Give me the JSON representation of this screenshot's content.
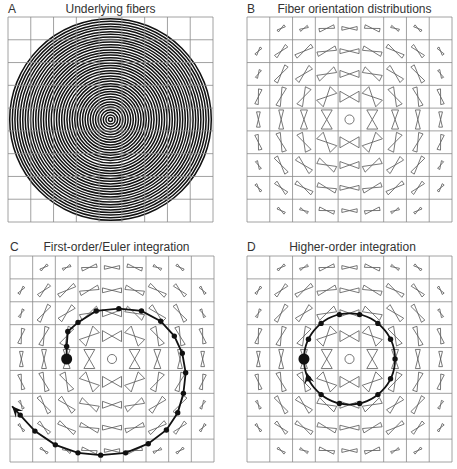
{
  "panels": [
    {
      "id": "A",
      "letter": "A",
      "title": "Underlying fibers",
      "kind": "fibers"
    },
    {
      "id": "B",
      "letter": "B",
      "title": "Fiber orientation distributions",
      "kind": "fod"
    },
    {
      "id": "C",
      "letter": "C",
      "title": "First-order/Euler integration",
      "kind": "fod",
      "trajectory": "euler"
    },
    {
      "id": "D",
      "letter": "D",
      "title": "Higher-order integration",
      "kind": "fod",
      "trajectory": "higher-order"
    }
  ],
  "grid": {
    "rows": 9,
    "cols": 9,
    "empty_cells": [
      [
        0,
        0
      ],
      [
        0,
        8
      ],
      [
        8,
        0
      ],
      [
        8,
        8
      ]
    ]
  },
  "colors": {
    "grid_line": "#8a8a8a",
    "fiber": "#111111",
    "glyph_stroke": "#555555",
    "trajectory": "#111111"
  },
  "trajectories": {
    "euler": {
      "description": "Spiral outward from seed at cell (4,2)",
      "points_in_cells": [
        [
          2.5,
          4.5
        ],
        [
          2.5,
          3.95
        ],
        [
          2.55,
          3.3
        ],
        [
          3.0,
          2.9
        ],
        [
          3.8,
          2.4
        ],
        [
          4.8,
          2.3
        ],
        [
          5.8,
          2.4
        ],
        [
          6.65,
          2.85
        ],
        [
          7.25,
          3.5
        ],
        [
          7.6,
          4.25
        ],
        [
          7.75,
          5.1
        ],
        [
          7.65,
          6.0
        ],
        [
          7.4,
          6.85
        ],
        [
          6.9,
          7.6
        ],
        [
          6.1,
          8.2
        ],
        [
          5.1,
          8.6
        ],
        [
          4.0,
          8.7
        ],
        [
          3.0,
          8.6
        ],
        [
          2.0,
          8.25
        ],
        [
          1.1,
          7.65
        ],
        [
          0.45,
          6.95
        ]
      ],
      "seed_index": 0,
      "arrow_at_end": true
    },
    "higher-order": {
      "description": "Closed circle around center",
      "center_cells": [
        4.5,
        4.5
      ],
      "radius_cells": 2.0,
      "n_points": 14,
      "seed_cells": [
        2.5,
        4.5
      ],
      "arrow_at_end": true
    }
  }
}
